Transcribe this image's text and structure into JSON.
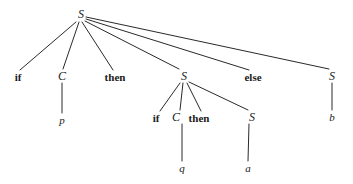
{
  "figure": {
    "kind": "parse-tree",
    "stroke_color": "#2a2a2a",
    "text_color": "#1a1a1a",
    "background_color": "#ffffff",
    "width": 353,
    "height": 184
  },
  "nodes": [
    {
      "id": "S0",
      "label": "S",
      "kind": "nonterminal",
      "x": 81,
      "y": 14
    },
    {
      "id": "if1",
      "label": "if",
      "kind": "keyword",
      "x": 18,
      "y": 77
    },
    {
      "id": "C1",
      "label": "C",
      "kind": "nonterminal",
      "x": 62,
      "y": 76
    },
    {
      "id": "then1",
      "label": "then",
      "kind": "keyword",
      "x": 115,
      "y": 77
    },
    {
      "id": "S1",
      "label": "S",
      "kind": "nonterminal",
      "x": 184,
      "y": 76
    },
    {
      "id": "else1",
      "label": "else",
      "kind": "keyword",
      "x": 253,
      "y": 77
    },
    {
      "id": "S2",
      "label": "S",
      "kind": "nonterminal",
      "x": 332,
      "y": 76
    },
    {
      "id": "p1",
      "label": "p",
      "kind": "variable",
      "x": 62,
      "y": 120
    },
    {
      "id": "if2",
      "label": "if",
      "kind": "keyword",
      "x": 156,
      "y": 118
    },
    {
      "id": "C2",
      "label": "C",
      "kind": "nonterminal",
      "x": 176,
      "y": 117
    },
    {
      "id": "then2",
      "label": "then",
      "kind": "keyword",
      "x": 199,
      "y": 118
    },
    {
      "id": "S3",
      "label": "S",
      "kind": "nonterminal",
      "x": 252,
      "y": 117
    },
    {
      "id": "b1",
      "label": "b",
      "kind": "variable",
      "x": 332,
      "y": 117
    },
    {
      "id": "q1",
      "label": "q",
      "kind": "variable",
      "x": 182,
      "y": 168
    },
    {
      "id": "a1",
      "label": "a",
      "kind": "variable",
      "x": 248,
      "y": 168
    }
  ],
  "edges": [
    {
      "from": "S0",
      "to": "if1",
      "x1": 76,
      "y1": 22,
      "x2": 20,
      "y2": 70
    },
    {
      "from": "S0",
      "to": "C1",
      "x1": 79,
      "y1": 22,
      "x2": 63,
      "y2": 69
    },
    {
      "from": "S0",
      "to": "then1",
      "x1": 82,
      "y1": 22,
      "x2": 113,
      "y2": 70
    },
    {
      "from": "S0",
      "to": "S1",
      "x1": 85,
      "y1": 21,
      "x2": 179,
      "y2": 69
    },
    {
      "from": "S0",
      "to": "else1",
      "x1": 86,
      "y1": 19,
      "x2": 249,
      "y2": 70
    },
    {
      "from": "S0",
      "to": "S2",
      "x1": 86,
      "y1": 17,
      "x2": 329,
      "y2": 69
    },
    {
      "from": "C1",
      "to": "p1",
      "x1": 62,
      "y1": 83,
      "x2": 62,
      "y2": 113
    },
    {
      "from": "S1",
      "to": "if2",
      "x1": 180,
      "y1": 83,
      "x2": 160,
      "y2": 111
    },
    {
      "from": "S1",
      "to": "C2",
      "x1": 183,
      "y1": 83,
      "x2": 180,
      "y2": 110
    },
    {
      "from": "S1",
      "to": "then2",
      "x1": 187,
      "y1": 83,
      "x2": 201,
      "y2": 111
    },
    {
      "from": "S1",
      "to": "S3",
      "x1": 189,
      "y1": 82,
      "x2": 248,
      "y2": 110
    },
    {
      "from": "C2",
      "to": "q1",
      "x1": 182,
      "y1": 124,
      "x2": 182,
      "y2": 161
    },
    {
      "from": "S3",
      "to": "a1",
      "x1": 249,
      "y1": 124,
      "x2": 248,
      "y2": 161
    },
    {
      "from": "S2",
      "to": "b1",
      "x1": 332,
      "y1": 83,
      "x2": 332,
      "y2": 110
    }
  ]
}
